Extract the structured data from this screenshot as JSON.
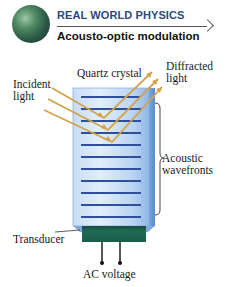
{
  "header": {
    "kicker": "REAL WORLD PHYSICS",
    "title": "Acousto-optic modulation",
    "icon": "globe-icon"
  },
  "diagram": {
    "labels": {
      "crystal": "Quartz crystal",
      "incident_line1": "Incident",
      "incident_line2": "light",
      "diffracted_line1": "Diffracted",
      "diffracted_line2": "light",
      "acoustic_line1": "Acoustic",
      "acoustic_line2": "wavefronts",
      "transducer": "Transducer",
      "ac_voltage": "AC voltage"
    },
    "colors": {
      "crystal_light": "#dbe9f8",
      "crystal_mid": "#a9c9ee",
      "crystal_edge": "#6a9ad6",
      "wavefront": "#2e4f9a",
      "ray": "#d4a24a",
      "transducer": "#1f6b55",
      "transducer_dark": "#154a3c",
      "header_blue": "#2a4a7f"
    },
    "wavefront_count": 11
  }
}
